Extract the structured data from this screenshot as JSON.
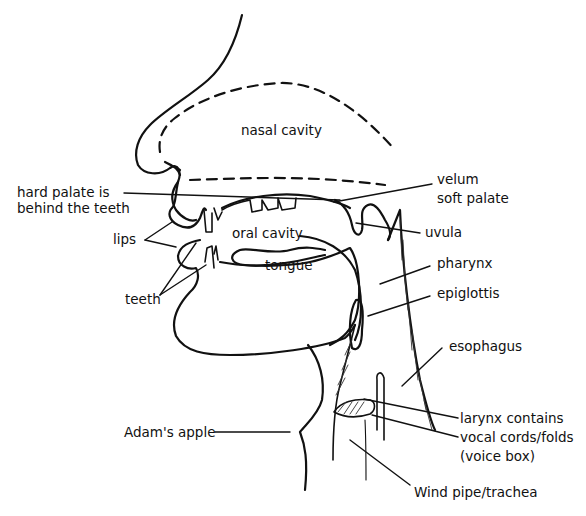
{
  "diagram": {
    "labels": {
      "nasal_cavity": "nasal cavity",
      "hard_palate_line1": "hard palate is",
      "hard_palate_line2": "behind the teeth",
      "velum_line1": "velum",
      "velum_line2": "soft palate",
      "lips": "lips",
      "oral_cavity": "oral cavity",
      "uvula": "uvula",
      "tongue": "tongue",
      "pharynx": "pharynx",
      "teeth": "teeth",
      "epiglottis": "epiglottis",
      "esophagus": "esophagus",
      "larynx_line1": "larynx contains",
      "larynx_line2": "vocal cords/folds",
      "larynx_line3": "(voice box)",
      "adams_apple": "Adam's apple",
      "trachea": "Wind pipe/trachea"
    },
    "colors": {
      "ink": "#111111",
      "background": "#ffffff"
    }
  }
}
